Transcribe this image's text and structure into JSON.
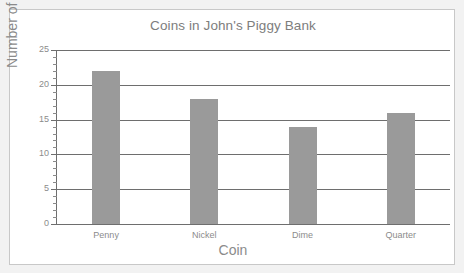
{
  "clipped_text_above": "",
  "chart_data": {
    "type": "bar",
    "title": "Coins in John's Piggy Bank",
    "xlabel": "Coin",
    "ylabel": "Number of coins",
    "categories": [
      "Penny",
      "Nickel",
      "Dime",
      "Quarter"
    ],
    "values": [
      22,
      18,
      14,
      16
    ],
    "ylim": [
      0,
      25
    ],
    "ytick_labels": [
      "0",
      "5",
      "10",
      "15",
      "20",
      "25"
    ],
    "ytick_values": [
      0,
      5,
      10,
      15,
      20,
      25
    ],
    "minor_tick_step": 1,
    "grid": "horizontal",
    "legend": "none",
    "bar_color": "#9a9a9a",
    "axis_color": "#6e6e6e",
    "text_color": "#8b8b8b",
    "title_color": "#7d7d7d",
    "plot_background": "#ffffff",
    "page_background": "#f2f2f2"
  }
}
